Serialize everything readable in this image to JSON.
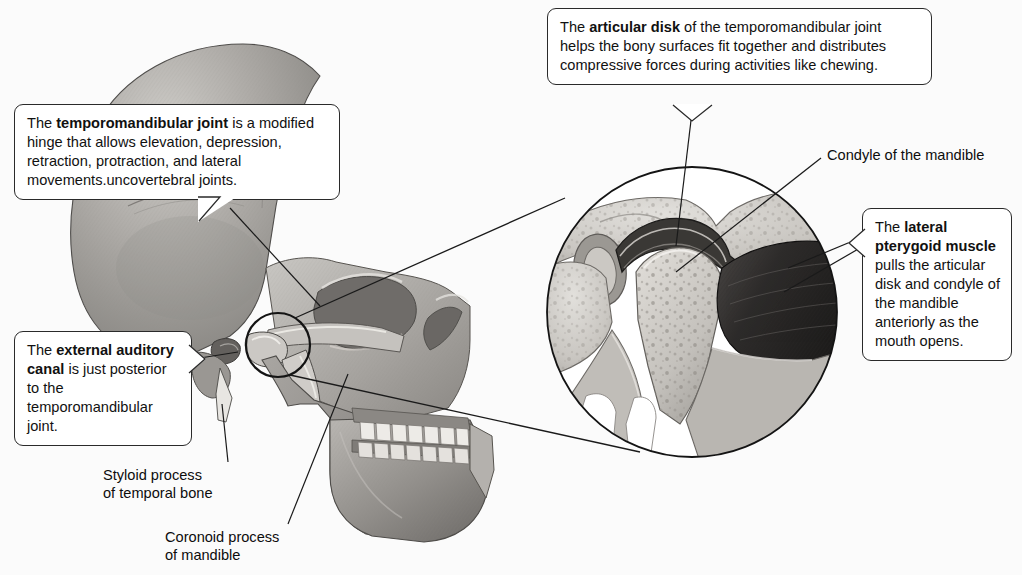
{
  "figure": {
    "background_color": "#fbfbfb",
    "callout_border_color": "#2a2a2a",
    "callout_fill_color": "#ffffff",
    "leader_line_color": "#1a1a1a",
    "bone_light_color": "#d8d6d2",
    "bone_mid_color": "#a9a6a2",
    "bone_dark_color": "#7d7a76",
    "muscle_color": "#2e2c2b",
    "tooth_color": "#eeece8"
  },
  "callouts": [
    {
      "id": "tmj",
      "name": "temporomandibular-joint-callout",
      "lead": "The ",
      "bold": "temporomandibular joint",
      "rest": " is a modified hinge that allows elevation, depression, retraction, protraction, and lateral movements.uncovertebral joints."
    },
    {
      "id": "disk",
      "name": "articular-disk-callout",
      "lead": "The ",
      "bold": "articular disk",
      "rest": " of the temporomandibular joint helps the bony surfaces fit together and distributes compressive forces during activities like chewing."
    },
    {
      "id": "eac",
      "name": "external-auditory-canal-callout",
      "lead": "The ",
      "bold": "external auditory canal",
      "rest": " is just posterior to the temporomandibular joint."
    },
    {
      "id": "pterygoid",
      "name": "lateral-pterygoid-callout",
      "lead": "The ",
      "bold": "lateral pterygoid muscle",
      "rest": " pulls the articular disk and condyle of the mandible anteriorly as the mouth opens."
    }
  ],
  "labels": {
    "condyle": "Condyle of the mandible",
    "styloid_line1": "Styloid process",
    "styloid_line2": "of temporal bone",
    "coronoid_line1": "Coronoid process",
    "coronoid_line2": "of mandible"
  },
  "structures": {
    "skull": "lateral-skull-illustration",
    "mandible": "mandible",
    "teeth": "teeth-row",
    "tmj_marker": "tmj-circle-marker",
    "inset": "magnified-tmj-cross-section",
    "inset_center_x": 692,
    "inset_center_y": 312,
    "inset_radius": 145,
    "articular_disk": "articular-disk",
    "condyle": "mandibular-condyle",
    "lateral_pterygoid": "lateral-pterygoid-muscle",
    "external_auditory_canal": "external-auditory-canal",
    "styloid_process": "styloid-process",
    "coronoid_process": "coronoid-process"
  }
}
